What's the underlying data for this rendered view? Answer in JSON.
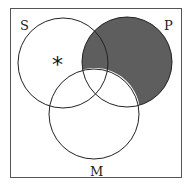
{
  "diagram": {
    "type": "venn",
    "sets": [
      {
        "id": "S",
        "label": "S"
      },
      {
        "id": "P",
        "label": "P"
      },
      {
        "id": "M",
        "label": "M"
      }
    ],
    "shaded_regions": [
      "P not M"
    ],
    "marks": [
      {
        "symbol": "*",
        "region": "S only"
      }
    ],
    "colors": {
      "shade": "#5e5e5e",
      "stroke": "#222222",
      "frame": "#555555",
      "background": "#ffffff"
    }
  }
}
